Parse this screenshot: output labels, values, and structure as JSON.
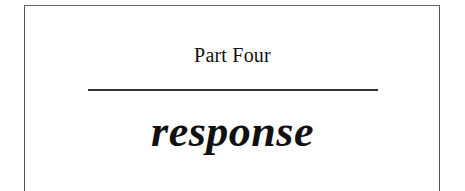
{
  "page": {
    "part_label": "Part Four",
    "section_title": "response"
  },
  "colors": {
    "text": "#111111",
    "rule": "#333333",
    "frame": "#555555",
    "background": "#ffffff"
  }
}
